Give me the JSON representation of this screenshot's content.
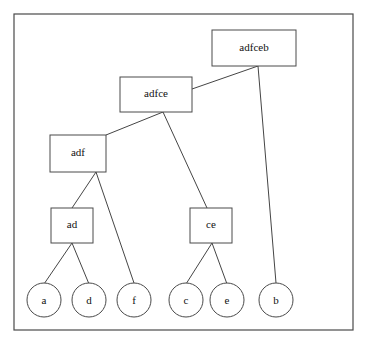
{
  "diagram": {
    "kind": "dendrogram-tree",
    "background_color": "#ffffff",
    "line_color": "#454545",
    "frame_color": "#4a4a4a",
    "text_color": "#111111",
    "frame": {
      "x": 14,
      "y": 14,
      "width": 339,
      "height": 316
    },
    "internal_nodes": [
      {
        "id": "adfceb",
        "label": "adfceb",
        "x": 212,
        "y": 30,
        "width": 84,
        "height": 36,
        "cx": 254,
        "cy": 48
      },
      {
        "id": "adfce",
        "label": "adfce",
        "x": 120,
        "y": 77,
        "width": 72,
        "height": 35,
        "cx": 156,
        "cy": 94
      },
      {
        "id": "adf",
        "label": "adf",
        "x": 50,
        "y": 135,
        "width": 56,
        "height": 37,
        "cx": 78,
        "cy": 153
      },
      {
        "id": "ad",
        "label": "ad",
        "x": 51,
        "y": 208,
        "width": 42,
        "height": 35,
        "cx": 72,
        "cy": 225
      },
      {
        "id": "ce",
        "label": "ce",
        "x": 190,
        "y": 208,
        "width": 42,
        "height": 35,
        "cx": 211,
        "cy": 225
      }
    ],
    "leaf_nodes": [
      {
        "id": "a",
        "label": "a",
        "cx": 44,
        "cy": 300,
        "r": 17
      },
      {
        "id": "d",
        "label": "d",
        "cx": 89,
        "cy": 300,
        "r": 17
      },
      {
        "id": "f",
        "label": "f",
        "cx": 134,
        "cy": 300,
        "r": 17
      },
      {
        "id": "c",
        "label": "c",
        "cx": 186,
        "cy": 300,
        "r": 17
      },
      {
        "id": "e",
        "label": "e",
        "cx": 227,
        "cy": 300,
        "r": 17
      },
      {
        "id": "b",
        "label": "b",
        "cx": 276,
        "cy": 300,
        "r": 17
      }
    ],
    "edges": [
      {
        "id": "adfceb-adfce",
        "from": "adfceb",
        "to": "adfce",
        "x1": 258,
        "y1": 66,
        "x2": 192,
        "y2": 89
      },
      {
        "id": "adfceb-b",
        "from": "adfceb",
        "to": "b",
        "x1": 258,
        "y1": 66,
        "x2": 276,
        "y2": 283
      },
      {
        "id": "adfce-adf",
        "from": "adfce",
        "to": "adf",
        "x1": 163,
        "y1": 112,
        "x2": 106,
        "y2": 135
      },
      {
        "id": "adfce-ce",
        "from": "adfce",
        "to": "ce",
        "x1": 163,
        "y1": 112,
        "x2": 207,
        "y2": 208
      },
      {
        "id": "adf-ad",
        "from": "adf",
        "to": "ad",
        "x1": 96,
        "y1": 172,
        "x2": 72,
        "y2": 208
      },
      {
        "id": "adf-f",
        "from": "adf",
        "to": "f",
        "x1": 96,
        "y1": 172,
        "x2": 134,
        "y2": 283
      },
      {
        "id": "ad-a",
        "from": "ad",
        "to": "a",
        "x1": 72,
        "y1": 243,
        "x2": 44,
        "y2": 284
      },
      {
        "id": "ad-d",
        "from": "ad",
        "to": "d",
        "x1": 72,
        "y1": 243,
        "x2": 89,
        "y2": 284
      },
      {
        "id": "ce-c",
        "from": "ce",
        "to": "c",
        "x1": 212,
        "y1": 243,
        "x2": 186,
        "y2": 284
      },
      {
        "id": "ce-e",
        "from": "ce",
        "to": "e",
        "x1": 212,
        "y1": 243,
        "x2": 227,
        "y2": 284
      }
    ]
  }
}
